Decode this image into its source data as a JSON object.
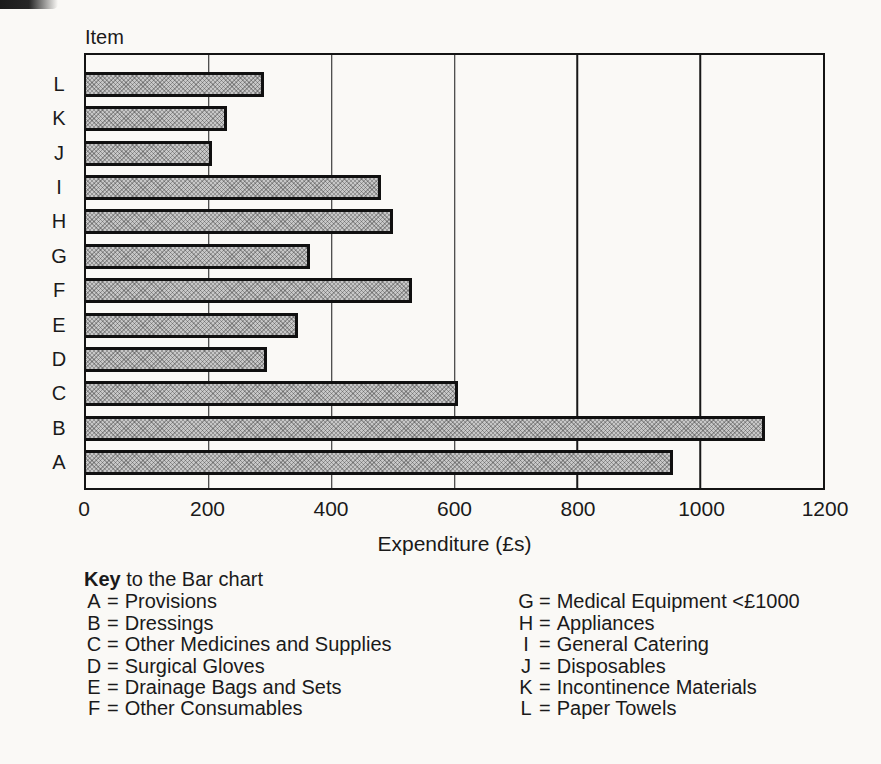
{
  "chart_data": {
    "type": "bar",
    "orientation": "horizontal",
    "y_axis_header": "Item",
    "xlabel": "Expenditure (£s)",
    "xlim": [
      0,
      1200
    ],
    "xticks": [
      0,
      200,
      400,
      600,
      800,
      1000,
      1200
    ],
    "grid": true,
    "categories_top_to_bottom": [
      "L",
      "K",
      "J",
      "I",
      "H",
      "G",
      "F",
      "E",
      "D",
      "C",
      "B",
      "A"
    ],
    "values_top_to_bottom": [
      290,
      230,
      205,
      480,
      500,
      365,
      530,
      345,
      295,
      605,
      1105,
      955
    ],
    "bar_fill_color": "#c7c7c7",
    "bar_border_color": "#101010",
    "ink_color": "#1a1a1a"
  },
  "key": {
    "title_bold": "Key",
    "title_rest": "to the Bar chart",
    "left_column": [
      {
        "letter": "A",
        "label": "Provisions"
      },
      {
        "letter": "B",
        "label": "Dressings"
      },
      {
        "letter": "C",
        "label": "Other Medicines and Supplies"
      },
      {
        "letter": "D",
        "label": "Surgical Gloves"
      },
      {
        "letter": "E",
        "label": "Drainage Bags and Sets"
      },
      {
        "letter": "F",
        "label": "Other Consumables"
      }
    ],
    "right_column": [
      {
        "letter": "G",
        "label": "Medical Equipment <£1000"
      },
      {
        "letter": "H",
        "label": "Appliances"
      },
      {
        "letter": "I",
        "label": "General Catering"
      },
      {
        "letter": "J",
        "label": "Disposables"
      },
      {
        "letter": "K",
        "label": "Incontinence Materials"
      },
      {
        "letter": "L",
        "label": "Paper Towels"
      }
    ]
  }
}
